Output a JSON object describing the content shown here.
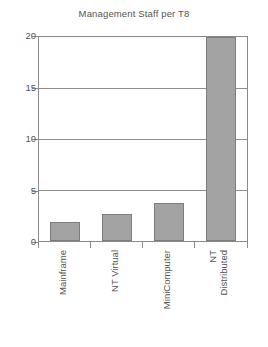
{
  "chart_data": {
    "type": "bar",
    "title": "Management Staff per T8",
    "xlabel": "",
    "ylabel": "",
    "categories": [
      "Mainframe",
      "NT Virtual",
      "MiniComputer",
      "NT Distributed"
    ],
    "values": [
      1.9,
      2.6,
      3.7,
      20
    ],
    "ylim": [
      0,
      20
    ],
    "yticks": [
      0,
      5,
      10,
      15,
      20
    ],
    "ytick_labels": [
      "0",
      "5",
      "10",
      "15",
      "20"
    ],
    "grid": "horizontal",
    "legend": "none",
    "bar_color": "#a3a3a3",
    "bar_border_color": "#7d7d7d",
    "axis_color": "#8a8a8a",
    "text_color": "#555555",
    "background": "#ffffff",
    "xtick_label_rotation": -90
  },
  "x_labels": [
    {
      "line1": "Mainframe",
      "line2": ""
    },
    {
      "line1": "NT Virtual",
      "line2": ""
    },
    {
      "line1": "MiniComputer",
      "line2": ""
    },
    {
      "line1": "NT",
      "line2": "Distributed"
    }
  ]
}
